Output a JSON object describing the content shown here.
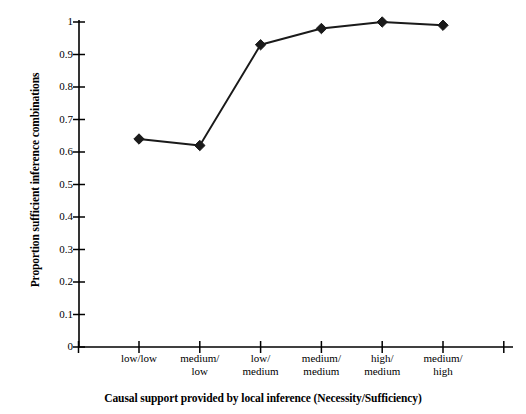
{
  "chart_data": {
    "type": "line",
    "title": "",
    "xlabel": "Causal support provided by local inference (Necessity/Sufficiency)",
    "ylabel": "Proportion sufficient inference combinations",
    "categories": [
      "low/low",
      "medium/low",
      "low/medium",
      "medium/medium",
      "high/medium",
      "medium/high"
    ],
    "category_lines": [
      [
        "low/low"
      ],
      [
        "medium/",
        "low"
      ],
      [
        "low/",
        "medium"
      ],
      [
        "medium/",
        "medium"
      ],
      [
        "high/",
        "medium"
      ],
      [
        "medium/",
        "high"
      ]
    ],
    "values": [
      0.64,
      0.62,
      0.93,
      0.98,
      1.0,
      0.99
    ],
    "ylim": [
      0,
      1
    ],
    "ytick_labels": [
      "1",
      "0.9",
      "0.8",
      "0.7",
      "0.6",
      "0.5",
      "0.4",
      "0.3",
      "0.2",
      "0.1",
      "0"
    ],
    "ytick_values": [
      1,
      0.9,
      0.8,
      0.7,
      0.6,
      0.5,
      0.4,
      0.3,
      0.2,
      0.1,
      0
    ],
    "grid": false,
    "legend": false,
    "marker": "diamond",
    "series_color": "#1a1a1a",
    "axis_color": "#000000",
    "background_color": "#ffffff"
  }
}
